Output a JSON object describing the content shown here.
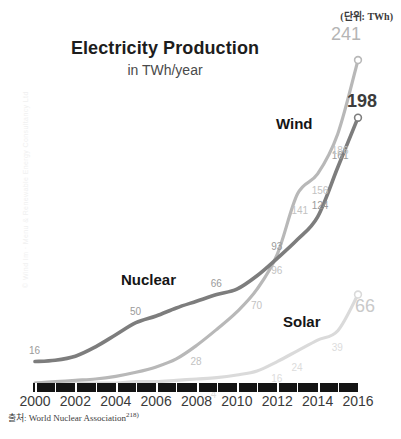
{
  "chart_data": {
    "type": "line",
    "title": "Electricity Production",
    "subtitle": "in TWh/year",
    "unit_note": "(단위: TWh)",
    "xlabel": "",
    "ylabel": "",
    "x": [
      2000,
      2001,
      2002,
      2003,
      2004,
      2005,
      2006,
      2007,
      2008,
      2009,
      2010,
      2011,
      2012,
      2013,
      2014,
      2015,
      2016
    ],
    "xlim": [
      2000,
      2016
    ],
    "ylim": [
      0,
      250
    ],
    "grid": false,
    "legend_position": "inline-labels",
    "tick_labels": [
      "2000",
      "2002",
      "2004",
      "2006",
      "2008",
      "2010",
      "2012",
      "2014",
      "2016"
    ],
    "series": [
      {
        "name": "Nuclear",
        "color": "#7d7d7d",
        "values": [
          16,
          17,
          20,
          27,
          36,
          45,
          50,
          56,
          61,
          66,
          70,
          80,
          93,
          107,
          124,
          161,
          198
        ],
        "point_labels": [
          {
            "year": 2000,
            "value": 16,
            "text": "16"
          },
          {
            "year": 2005,
            "value": 45,
            "text": "50"
          },
          {
            "year": 2009,
            "value": 66,
            "text": "66"
          },
          {
            "year": 2012,
            "value": 93,
            "text": "93"
          },
          {
            "year": 2014,
            "value": 124,
            "text": "124"
          },
          {
            "year": 2015,
            "value": 161,
            "text": "161"
          }
        ],
        "end_value": 198,
        "end_label": "198"
      },
      {
        "name": "Wind",
        "color": "#b8b8b8",
        "values": [
          0,
          1,
          2,
          3,
          5,
          8,
          12,
          18,
          28,
          40,
          53,
          70,
          96,
          141,
          156,
          186,
          241
        ],
        "point_labels": [
          {
            "year": 2008,
            "value": 28,
            "text": "28"
          },
          {
            "year": 2011,
            "value": 70,
            "text": "70"
          },
          {
            "year": 2012,
            "value": 96,
            "text": "96"
          },
          {
            "year": 2013,
            "value": 141,
            "text": "141"
          },
          {
            "year": 2014,
            "value": 156,
            "text": "156"
          },
          {
            "year": 2015,
            "value": 186,
            "text": "186"
          }
        ],
        "end_value": 241,
        "end_label": "241"
      },
      {
        "name": "Solar",
        "color": "#dadada",
        "values": [
          0,
          0,
          0,
          0,
          0,
          1,
          1,
          2,
          3,
          4,
          6,
          9,
          16,
          24,
          32,
          39,
          66
        ],
        "point_labels": [
          {
            "year": 2009,
            "value": 4,
            "text": "4"
          },
          {
            "year": 2011,
            "value": 9,
            "text": "0"
          },
          {
            "year": 2012,
            "value": 16,
            "text": "16"
          },
          {
            "year": 2013,
            "value": 24,
            "text": "24"
          },
          {
            "year": 2015,
            "value": 39,
            "text": "39"
          }
        ],
        "end_value": 66,
        "end_label": "66"
      }
    ]
  },
  "source": {
    "prefix": "출처:",
    "text": "World Nuclear Association",
    "footnote": "218)"
  },
  "watermark": {
    "text": "© Wind Im · Menu & Renewable Energy Consultancy Ltd"
  },
  "colors": {
    "nuclear": "#7d7d7d",
    "wind": "#b8b8b8",
    "solar": "#dadada",
    "axis": "#141414",
    "title": "#1d1d1d"
  }
}
